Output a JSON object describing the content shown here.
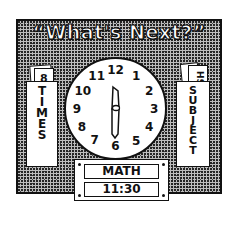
{
  "title": "“What's Next?”",
  "clock": {
    "numbers": [
      "12",
      "1",
      "2",
      "3",
      "4",
      "5",
      "6",
      "7",
      "8",
      "9",
      "10",
      "11"
    ],
    "hour_hand_points_to": "12",
    "minute_hand_points_to": "6",
    "displayed_time": "11:30"
  },
  "left_pocket": {
    "label_letters": [
      "T",
      "I",
      "M",
      "E",
      "S"
    ],
    "label": "TIMES",
    "card_text": "8"
  },
  "right_pocket": {
    "label_letters": [
      "S",
      "U",
      "B",
      "J",
      "E",
      "C",
      "T"
    ],
    "label": "SUBJECT",
    "card_text": "HS"
  },
  "schedule": {
    "subject": "MATH",
    "time": "11:30"
  },
  "colors": {
    "ink": "#111111",
    "paper": "#ffffff",
    "stipple": "#bdbdbd"
  }
}
